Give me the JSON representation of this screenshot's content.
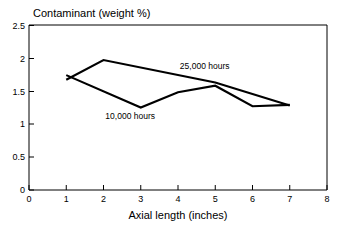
{
  "chart_data": {
    "type": "line",
    "title": "Contaminant (weight %)",
    "xlabel": "Axial length (inches)",
    "ylabel": "Contaminant (weight %)",
    "xlim": [
      0,
      8
    ],
    "ylim": [
      0,
      2.5
    ],
    "xticks": [
      "0",
      "1",
      "2",
      "3",
      "4",
      "5",
      "6",
      "7",
      "8"
    ],
    "yticks": [
      "0",
      "0.5",
      "1",
      "1.5",
      "2",
      "2.5"
    ],
    "grid": false,
    "legend_position": "inline-annotations",
    "series": [
      {
        "name": "25,000 hours",
        "label_x": 4.05,
        "label_y": 1.83,
        "x": [
          1,
          2,
          5,
          7
        ],
        "y": [
          1.67,
          1.97,
          1.63,
          1.28
        ]
      },
      {
        "name": "10,000 hours",
        "label_x": 2.05,
        "label_y": 1.08,
        "x": [
          1,
          3,
          4,
          5,
          6,
          7
        ],
        "y": [
          1.74,
          1.25,
          1.48,
          1.58,
          1.27,
          1.29
        ]
      }
    ]
  }
}
